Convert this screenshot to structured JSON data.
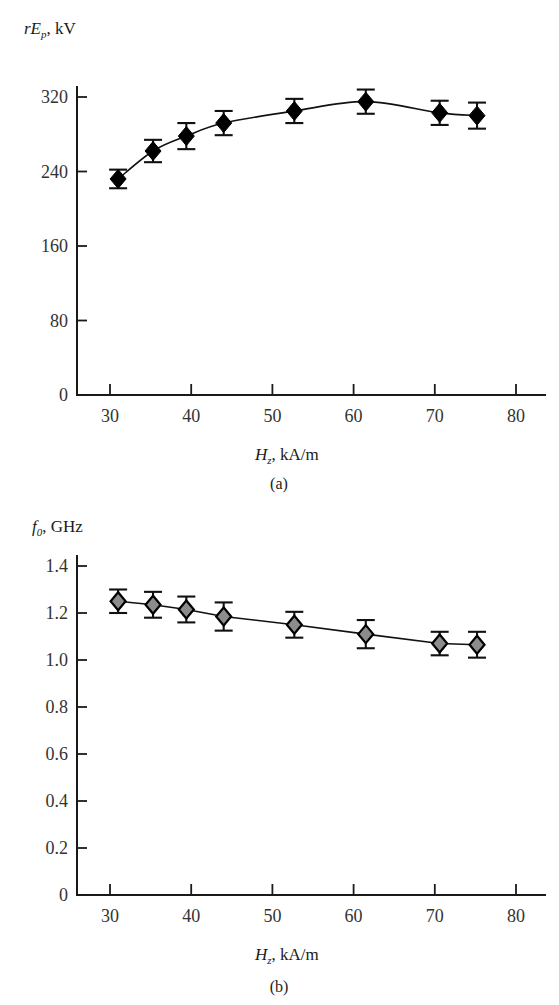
{
  "figure": {
    "panel_a_caption": "(a)",
    "panel_b_caption": "(b)"
  },
  "chart_data": [
    {
      "type": "scatter",
      "panel": "a",
      "title": "",
      "ylabel": "rEp, kV",
      "ylabel_parts": {
        "italic_lead": "rE",
        "subscript": "p",
        "units": ", kV"
      },
      "xlabel": "Hz, kA/m",
      "xlabel_parts": {
        "italic_lead": "H",
        "subscript": "z",
        "units": ", kA/m"
      },
      "xlim": [
        25,
        85
      ],
      "ylim": [
        0,
        360
      ],
      "xticks": [
        30,
        40,
        50,
        60,
        70,
        80
      ],
      "xtick_labels": [
        "30",
        "40",
        "50",
        "60",
        "70",
        "80"
      ],
      "yticks": [
        0,
        80,
        160,
        240,
        320
      ],
      "ytick_labels": [
        "0",
        "80",
        "160",
        "240",
        "320"
      ],
      "grid": false,
      "legend": "none",
      "marker": "filled-diamond-black",
      "x": [
        31,
        35.3,
        39.4,
        44,
        52.7,
        61.5,
        70.6,
        75.2
      ],
      "y": [
        232,
        262,
        278,
        292,
        305,
        315,
        303,
        300
      ],
      "yerr": [
        10,
        12,
        14,
        13,
        13,
        13,
        13,
        14
      ]
    },
    {
      "type": "scatter",
      "panel": "b",
      "title": "",
      "ylabel": "f0, GHz",
      "ylabel_parts": {
        "italic_lead": "f",
        "subscript": "0",
        "units": ", GHz"
      },
      "xlabel": "Hz, kA/m",
      "xlabel_parts": {
        "italic_lead": "H",
        "subscript": "z",
        "units": ", kA/m"
      },
      "xlim": [
        25,
        85
      ],
      "ylim": [
        0,
        1.5
      ],
      "xticks": [
        30,
        40,
        50,
        60,
        70,
        80
      ],
      "xtick_labels": [
        "30",
        "40",
        "50",
        "60",
        "70",
        "80"
      ],
      "yticks": [
        0,
        0.2,
        0.4,
        0.6,
        0.8,
        1.0,
        1.2,
        1.4
      ],
      "ytick_labels": [
        "0",
        "0.2",
        "0.4",
        "0.6",
        "0.8",
        "1.0",
        "1.2",
        "1.4"
      ],
      "grid": false,
      "legend": "none",
      "marker": "filled-diamond-gray",
      "x": [
        31,
        35.3,
        39.4,
        44,
        52.7,
        61.5,
        70.6,
        75.2
      ],
      "y": [
        1.25,
        1.235,
        1.215,
        1.185,
        1.15,
        1.11,
        1.07,
        1.065
      ],
      "yerr": [
        0.05,
        0.055,
        0.055,
        0.06,
        0.055,
        0.06,
        0.05,
        0.055
      ]
    }
  ],
  "colors": {
    "marker_a_fill": "#000000",
    "marker_b_fill": "#8c8c8c",
    "line": "#111111",
    "axis": "#1a1a1a",
    "background": "#ffffff"
  }
}
